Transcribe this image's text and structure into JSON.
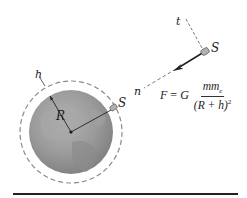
{
  "figure": {
    "type": "orbital mechanics diagram",
    "labels": {
      "tangent_axis": "t",
      "normal_axis": "n",
      "satellite_far": "S",
      "satellite_orbit": "S",
      "radius": "R",
      "altitude": "h"
    },
    "formula": {
      "lhs": "F",
      "equals": "=",
      "constant": "G",
      "numerator": "mm",
      "numerator_sub": "e",
      "denominator": "(R + h)",
      "denominator_sup": "2",
      "text": "F = G mm_e / (R + h)^2"
    },
    "colors": {
      "earth_fill": "#9a9a9a",
      "earth_shade": "#7e7e7e",
      "orbit_dash": "#8a8a8a",
      "ink": "#222222",
      "satellite": "#b0b0b0",
      "background": "#ffffff"
    },
    "geometry": {
      "earth_center": [
        71,
        132
      ],
      "earth_radius": 42,
      "orbit_radius": 51
    }
  }
}
